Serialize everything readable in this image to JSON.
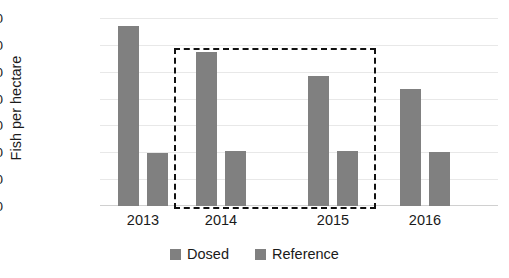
{
  "chart_data": {
    "type": "bar",
    "title": "",
    "subtitle": "",
    "xlabel": "",
    "ylabel": "Fish per hectare",
    "categories": [
      "2013",
      "2014",
      "2015",
      "2016"
    ],
    "series": [
      {
        "name": "Dosed",
        "values": [
          13380,
          11480,
          9660,
          8750
        ]
      },
      {
        "name": "Reference",
        "values": [
          3950,
          4100,
          4100,
          4050
        ]
      }
    ],
    "ylim": [
      0,
      14000
    ],
    "ytick_values": [
      0,
      2000,
      4000,
      6000,
      8000,
      10000,
      12000,
      14000
    ],
    "ytick_labels": [
      "0",
      "2,000",
      "4,000",
      "6,000",
      "8,000",
      "10,000",
      "12,000",
      "14,000"
    ],
    "grid": true,
    "grid_axis": "y",
    "legend_position": "bottom",
    "legend_entries": [
      "Dosed",
      "Reference"
    ],
    "bar_color": "#808080",
    "annotations": [
      {
        "type": "dashed-rectangle",
        "covers_categories": [
          "2014",
          "2015"
        ],
        "color": "#111111",
        "style": "dashed"
      }
    ]
  },
  "axis": {
    "y_title": "Fish per hectare"
  },
  "legend": {
    "items": [
      {
        "label": "Dosed",
        "color": "#808080"
      },
      {
        "label": "Reference",
        "color": "#808080"
      }
    ]
  }
}
